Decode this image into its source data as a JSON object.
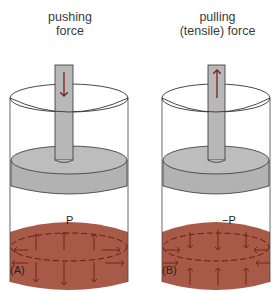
{
  "panels": [
    {
      "id": "A",
      "title_line1": "pushing",
      "title_line2": "force",
      "panel_label": "(A)",
      "pressure_label": "P",
      "rod_arrow_direction": "down",
      "fluid_arrow_direction": "outward"
    },
    {
      "id": "B",
      "title_line1": "pulling",
      "title_line2": "(tensile) force",
      "panel_label": "(B)",
      "pressure_label": "−P",
      "rod_arrow_direction": "up",
      "fluid_arrow_direction": "inward"
    }
  ],
  "colors": {
    "fluid": "#a85a48",
    "fluid_arrow": "#7a1f14",
    "piston": "#b4b4b4",
    "outline": "#333333",
    "rod_arrow": "#7a1f14"
  }
}
